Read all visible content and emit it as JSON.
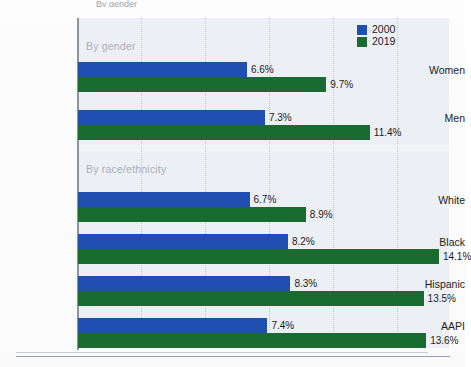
{
  "clipped_title": "By gender",
  "legend": {
    "entries": [
      {
        "label": "2000",
        "color": "#1f4fb0"
      },
      {
        "label": "2019",
        "color": "#1a6b31"
      }
    ]
  },
  "sections": [
    {
      "caption": "By gender"
    },
    {
      "caption": "By race/ethnicity"
    }
  ],
  "rows": [
    {
      "label": "Women",
      "v2000": 6.6,
      "v2019": 9.7,
      "t2000": "6.6%",
      "t2019": "9.7%"
    },
    {
      "label": "Men",
      "v2000": 7.3,
      "v2019": 11.4,
      "t2000": "7.3%",
      "t2019": "11.4%"
    },
    {
      "label": "White",
      "v2000": 6.7,
      "v2019": 8.9,
      "t2000": "6.7%",
      "t2019": "8.9%"
    },
    {
      "label": "Black",
      "v2000": 8.2,
      "v2019": 14.1,
      "t2000": "8.2%",
      "t2019": "14.1%"
    },
    {
      "label": "Hispanic",
      "v2000": 8.3,
      "v2019": 13.5,
      "t2000": "8.3%",
      "t2019": "13.5%"
    },
    {
      "label": "AAPI",
      "v2000": 7.4,
      "v2019": 13.6,
      "t2000": "7.4%",
      "t2019": "13.6%"
    }
  ],
  "chart_data": {
    "type": "bar",
    "orientation": "horizontal",
    "title": "By gender",
    "xlabel": "",
    "ylabel": "",
    "xlim": [
      0,
      14.6
    ],
    "grid": true,
    "legend_position": "top-right",
    "categories": [
      "Women",
      "Men",
      "White",
      "Black",
      "Hispanic",
      "AAPI"
    ],
    "group_captions": {
      "By gender": [
        "Women",
        "Men"
      ],
      "By race/ethnicity": [
        "White",
        "Black",
        "Hispanic",
        "AAPI"
      ]
    },
    "series": [
      {
        "name": "2000",
        "color": "#1f4fb0",
        "values": [
          6.6,
          7.3,
          6.7,
          8.2,
          8.3,
          7.4
        ],
        "labels": [
          "6.6%",
          "7.3%",
          "6.7%",
          "8.2%",
          "8.3%",
          "7.4%"
        ]
      },
      {
        "name": "2019",
        "color": "#1a6b31",
        "values": [
          9.7,
          11.4,
          8.9,
          14.1,
          13.5,
          13.6
        ],
        "labels": [
          "9.7%",
          "11.4%",
          "8.9%",
          "14.1%",
          "13.5%",
          "13.6%"
        ]
      }
    ],
    "value_unit": "percent",
    "gridline_values": [
      2.5,
      5.0,
      7.5,
      10.0,
      12.5
    ]
  }
}
